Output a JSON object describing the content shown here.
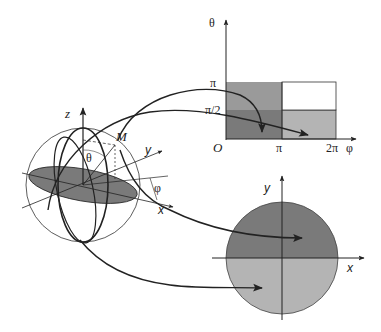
{
  "figure": {
    "colors": {
      "dark_gray": "#7a7a7a",
      "mid_gray": "#9a9a9a",
      "light_gray": "#b4b4b4",
      "white": "#ffffff",
      "line": "#222222"
    }
  },
  "sphere": {
    "axis_z_label": "z",
    "axis_y_label": "y",
    "axis_x_label": "x",
    "point_label": "M",
    "polar_angle_label": "θ",
    "azimuth_angle_label": "φ"
  },
  "rectangle_plot": {
    "y_axis_label": "θ",
    "x_axis_label": "φ",
    "origin_label": "O",
    "y_ticks": [
      "π",
      "π/2"
    ],
    "x_ticks": [
      "π",
      "2π"
    ],
    "cells": [
      {
        "region": "theta 0..π/2, phi 0..π",
        "shade": "dark_gray"
      },
      {
        "region": "theta 0..π/2, phi π..2π",
        "shade": "light_gray"
      },
      {
        "region": "theta π/2..π, phi 0..π",
        "shade": "mid_gray"
      },
      {
        "region": "theta π/2..π, phi π..2π",
        "shade": "white"
      }
    ]
  },
  "disk_plot": {
    "y_axis_label": "y",
    "x_axis_label": "x",
    "upper_half_shade": "dark_gray",
    "lower_half_shade": "light_gray"
  },
  "arrows": [
    {
      "from": "sphere upper meridian",
      "to": "rectangle lower-left cell"
    },
    {
      "from": "sphere point M",
      "to": "rectangle lower-right cell"
    },
    {
      "from": "sphere x-axis region",
      "to": "disk upper half"
    },
    {
      "from": "sphere lower meridian",
      "to": "disk lower half"
    }
  ]
}
